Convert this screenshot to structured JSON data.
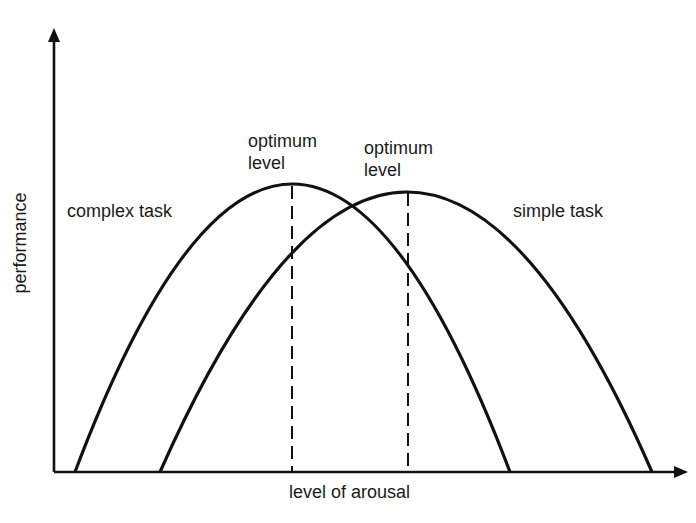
{
  "diagram": {
    "title": "",
    "type": "inverted-U (Yerkes-Dodson) curves",
    "axes": {
      "y_label": "performance",
      "x_label": "level of arousal"
    },
    "curves": [
      {
        "name": "complex-task",
        "label": "complex task",
        "start": [
          75,
          472
        ],
        "peak": [
          292,
          184
        ],
        "end": [
          510,
          472
        ]
      },
      {
        "name": "simple-task",
        "label": "simple task",
        "start": [
          160,
          472
        ],
        "peak": [
          408,
          192
        ],
        "end": [
          652,
          472
        ]
      }
    ],
    "optimum_markers": [
      {
        "line1": "optimum",
        "line2": "level",
        "x": 292
      },
      {
        "line1": "optimum",
        "line2": "level",
        "x": 408
      }
    ],
    "colors": {
      "line": "#111111",
      "background": "#ffffff"
    }
  }
}
